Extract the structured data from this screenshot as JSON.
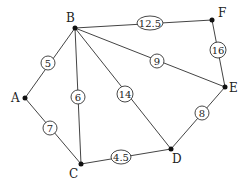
{
  "graph": {
    "nodes": [
      {
        "id": "A",
        "label": "A",
        "x": 25,
        "y": 98
      },
      {
        "id": "B",
        "label": "B",
        "x": 75,
        "y": 28
      },
      {
        "id": "C",
        "label": "C",
        "x": 81,
        "y": 164
      },
      {
        "id": "D",
        "label": "D",
        "x": 171,
        "y": 149
      },
      {
        "id": "E",
        "label": "E",
        "x": 225,
        "y": 87
      },
      {
        "id": "F",
        "label": "F",
        "x": 212,
        "y": 20
      }
    ],
    "edges": [
      {
        "from": "A",
        "to": "B",
        "weight": "5"
      },
      {
        "from": "A",
        "to": "C",
        "weight": "7"
      },
      {
        "from": "B",
        "to": "C",
        "weight": "6"
      },
      {
        "from": "B",
        "to": "D",
        "weight": "14"
      },
      {
        "from": "B",
        "to": "E",
        "weight": "9"
      },
      {
        "from": "B",
        "to": "F",
        "weight": "12.5"
      },
      {
        "from": "C",
        "to": "D",
        "weight": "4.5"
      },
      {
        "from": "D",
        "to": "E",
        "weight": "8"
      },
      {
        "from": "E",
        "to": "F",
        "weight": "16"
      }
    ]
  }
}
